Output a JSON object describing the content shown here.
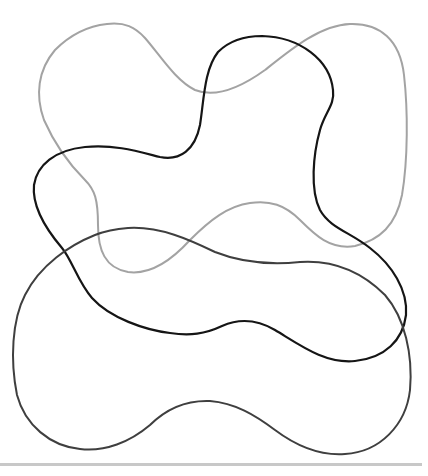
{
  "figure": {
    "background": "#ffffff",
    "shapes": [
      {
        "name": "light-gray-blob",
        "stroke": "#a3a3a3",
        "stroke_width": 2
      },
      {
        "name": "black-blob",
        "stroke": "#151515",
        "stroke_width": 2.2
      },
      {
        "name": "dark-gray-blob",
        "stroke": "#3f3f3f",
        "stroke_width": 2
      }
    ],
    "baseline": {
      "color": "#c8c8c8"
    }
  }
}
